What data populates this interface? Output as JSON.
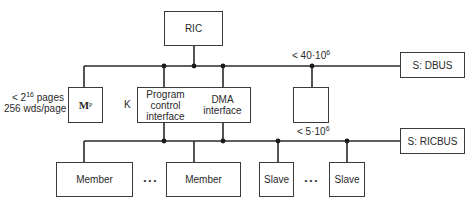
{
  "diagram": {
    "nodes": {
      "ric": {
        "label": "RIC"
      },
      "dbus_switch": {
        "label": "S: DBUS"
      },
      "ricbus_switch": {
        "label": "S: RICBUS"
      },
      "mp": {
        "label_main": "M",
        "label_sub": "P"
      },
      "k_program": {
        "line1": "Program",
        "line2": "control",
        "line3": "interface"
      },
      "k_dma": {
        "line1": "DMA",
        "line2": "interface"
      },
      "k_label": "K",
      "empty_box": {
        "label": ""
      },
      "member1": {
        "label": "Member"
      },
      "member2": {
        "label": "Member"
      },
      "slave1": {
        "label": "Slave"
      },
      "slave2": {
        "label": "Slave"
      }
    },
    "annotations": {
      "mp_pages_prefix": "< 2",
      "mp_pages_exp": "16",
      "mp_pages_suffix": " pages",
      "mp_words": "256 wds/page",
      "dbus_rate_prefix": "< 40·10",
      "dbus_rate_exp": "6",
      "ricbus_rate_prefix": "< 5·10",
      "ricbus_rate_exp": "6",
      "member_ellipsis": "• • •",
      "slave_ellipsis": "• • •"
    },
    "edges": [
      {
        "from": "RIC",
        "to": "DBUS"
      },
      {
        "from": "DBUS",
        "to": "S: DBUS"
      },
      {
        "from": "DBUS",
        "to": "Mp"
      },
      {
        "from": "DBUS",
        "to": "Program control interface"
      },
      {
        "from": "DBUS",
        "to": "DMA interface"
      },
      {
        "from": "DBUS",
        "to": "empty box"
      },
      {
        "from": "Program control interface",
        "to": "RICBUS"
      },
      {
        "from": "DMA interface",
        "to": "RICBUS"
      },
      {
        "from": "RICBUS",
        "to": "S: RICBUS"
      },
      {
        "from": "RICBUS",
        "to": "Member"
      },
      {
        "from": "RICBUS",
        "to": "Member"
      },
      {
        "from": "RICBUS",
        "to": "Slave"
      },
      {
        "from": "RICBUS",
        "to": "Slave"
      }
    ]
  }
}
